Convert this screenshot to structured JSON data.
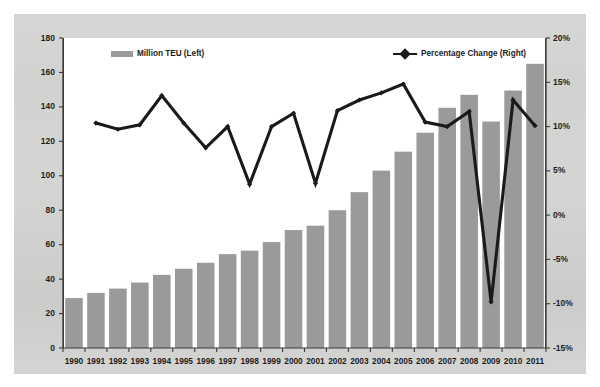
{
  "chart_data": {
    "type": "bar",
    "title": "",
    "subtitle": "",
    "xlabel": "",
    "ylabel": "",
    "y2label": "",
    "grid": false,
    "legend_position": "top",
    "categories": [
      "1990",
      "1991",
      "1992",
      "1993",
      "1994",
      "1995",
      "1996",
      "1997",
      "1998",
      "1999",
      "2000",
      "2001",
      "2002",
      "2003",
      "2004",
      "2005",
      "2006",
      "2007",
      "2008",
      "2009",
      "2010",
      "2011"
    ],
    "ylim": [
      0,
      180
    ],
    "yticks": [
      0,
      20,
      40,
      60,
      80,
      100,
      120,
      140,
      160,
      180
    ],
    "ytick_labels": [
      "0",
      "20",
      "40",
      "60",
      "80",
      "100",
      "120",
      "140",
      "160",
      "180"
    ],
    "y2lim": [
      -15,
      20
    ],
    "y2ticks": [
      -15,
      -10,
      -5,
      0,
      5,
      10,
      15,
      20
    ],
    "y2tick_labels": [
      "-15%",
      "-10%",
      "-5%",
      "0%",
      "5%",
      "10%",
      "15%",
      "20%"
    ],
    "series": [
      {
        "name": "Million TEU (Left)",
        "type": "bar",
        "axis": "left",
        "color": "#9a9a9a",
        "values": [
          29,
          32,
          34.5,
          38,
          42.5,
          46,
          49.5,
          54.5,
          56.5,
          61.5,
          68.5,
          71,
          80,
          90.5,
          103,
          114,
          125,
          139.5,
          147,
          131.5,
          149.5,
          165
        ]
      },
      {
        "name": "Percentage Change (Right)",
        "type": "line",
        "axis": "right",
        "color": "#1a1a1a",
        "values": [
          null,
          10.4,
          9.7,
          10.2,
          13.5,
          10.4,
          7.6,
          10.0,
          3.5,
          10.0,
          11.5,
          3.6,
          11.8,
          13.0,
          13.8,
          14.8,
          10.5,
          10.0,
          11.7,
          -9.8,
          13.0,
          10.1
        ]
      }
    ]
  },
  "legend": {
    "bar_label": "Million TEU (Left)",
    "line_label": "Percentage Change (Right)"
  },
  "colors": {
    "bar_fill": "#9a9a9a",
    "line_stroke": "#1a1a1a",
    "axis": "#3b3b3b",
    "panel_background": "#ffffff",
    "outer_background": "#d2d2d0"
  }
}
